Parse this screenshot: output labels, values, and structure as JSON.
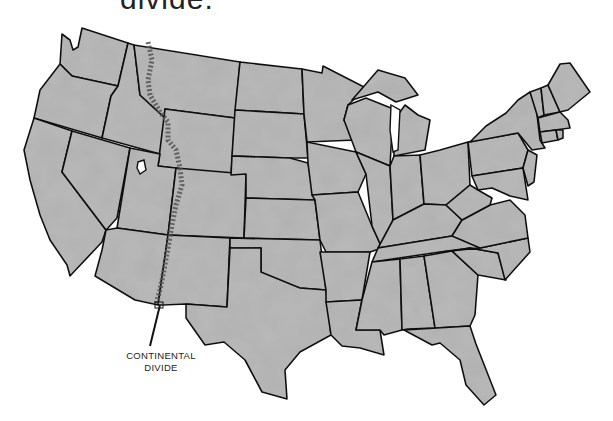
{
  "title": "divide.",
  "map": {
    "subject": "Contiguous United States",
    "fill_color": "#b9b9b9",
    "border_color": "#111111",
    "feature": "continental-divide"
  },
  "label": {
    "line1": "CONTINENTAL",
    "line2": "DIVIDE"
  }
}
